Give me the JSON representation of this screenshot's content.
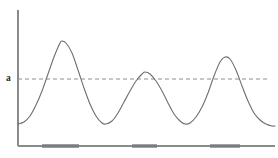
{
  "figure": {
    "threshold_label": "a",
    "colors": {
      "axis": "#8a8a8a",
      "curve": "#6e6e72",
      "threshold": "#8e8e92",
      "interval_bar": "#7b7b80",
      "background": "#ffffff",
      "label_text": "#2a2a2a"
    }
  },
  "chart_data": {
    "type": "line",
    "title": "",
    "subtitle": "",
    "xlabel": "",
    "ylabel": "",
    "xlim": [
      18,
      275
    ],
    "ylim": [
      146,
      10
    ],
    "grid": false,
    "legend": null,
    "annotations": [
      {
        "name": "threshold-label",
        "text": "a",
        "x": 10,
        "y": 79,
        "describes": "horizontal dashed threshold level a"
      }
    ],
    "axes": {
      "y_axis": {
        "x": 18,
        "y_top": 10,
        "y_bottom": 146
      },
      "x_axis": {
        "y": 146,
        "x_left": 18,
        "x_right": 275
      },
      "ticks": [],
      "tick_labels": []
    },
    "series": [
      {
        "name": "signal",
        "type": "line",
        "points": [
          [
            18,
            124
          ],
          [
            24,
            122
          ],
          [
            30,
            116
          ],
          [
            36,
            105
          ],
          [
            42,
            91
          ],
          [
            48,
            74
          ],
          [
            54,
            57
          ],
          [
            60,
            43
          ],
          [
            62,
            41
          ],
          [
            66,
            43
          ],
          [
            72,
            53
          ],
          [
            78,
            70
          ],
          [
            84,
            88
          ],
          [
            90,
            104
          ],
          [
            96,
            116
          ],
          [
            102,
            123
          ],
          [
            106,
            124
          ],
          [
            112,
            121
          ],
          [
            118,
            113
          ],
          [
            124,
            102
          ],
          [
            130,
            91
          ],
          [
            136,
            81
          ],
          [
            142,
            74
          ],
          [
            145,
            72
          ],
          [
            150,
            74
          ],
          [
            156,
            81
          ],
          [
            162,
            91
          ],
          [
            168,
            103
          ],
          [
            174,
            114
          ],
          [
            180,
            121
          ],
          [
            185,
            124
          ],
          [
            190,
            123
          ],
          [
            196,
            117
          ],
          [
            202,
            107
          ],
          [
            208,
            93
          ],
          [
            214,
            76
          ],
          [
            220,
            62
          ],
          [
            225,
            57
          ],
          [
            230,
            59
          ],
          [
            236,
            70
          ],
          [
            242,
            86
          ],
          [
            248,
            101
          ],
          [
            254,
            113
          ],
          [
            260,
            120
          ],
          [
            266,
            124
          ],
          [
            272,
            126
          ],
          [
            275,
            126
          ]
        ]
      }
    ],
    "threshold": {
      "name": "a",
      "value_y": 79,
      "style": "dashed",
      "x_start": 18,
      "x_end": 268
    },
    "intervals_above_threshold": [
      {
        "index": 1,
        "x_start": 42,
        "x_end": 79
      },
      {
        "index": 2,
        "x_start": 132,
        "x_end": 157
      },
      {
        "index": 3,
        "x_start": 210,
        "x_end": 240
      }
    ],
    "peaks": [
      {
        "index": 1,
        "x": 61,
        "y": 41
      },
      {
        "index": 2,
        "x": 144,
        "y": 72
      },
      {
        "index": 3,
        "x": 224,
        "y": 57
      }
    ],
    "troughs": [
      {
        "index": 1,
        "x": 104,
        "y": 124
      },
      {
        "index": 2,
        "x": 185,
        "y": 124
      }
    ]
  }
}
